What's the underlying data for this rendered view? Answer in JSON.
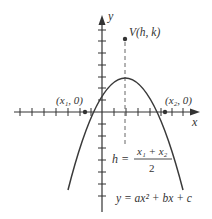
{
  "diagram": {
    "type": "parabola-graph",
    "colors": {
      "axis": "#333333",
      "curve": "#3a3a3a",
      "dashed_line": "#666666",
      "text": "#333333",
      "background": "#ffffff"
    },
    "axes": {
      "x_label": "x",
      "y_label": "y"
    },
    "vertex": {
      "label": "V(h, k)"
    },
    "intercepts": {
      "left_label": "(x₁, 0)",
      "right_label": "(x₂, 0)"
    },
    "formulas": {
      "h_lhs": "h =",
      "h_numerator": "x₁ + x₂",
      "h_denominator": "2",
      "equation": "y = ax² + bx + c"
    }
  }
}
